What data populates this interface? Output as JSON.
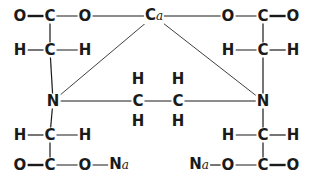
{
  "diagram": {
    "title": "",
    "atoms": [
      {
        "id": "o1",
        "label": "O",
        "x": 20,
        "y": 16
      },
      {
        "id": "c1",
        "label": "C",
        "x": 50,
        "y": 16
      },
      {
        "id": "o2",
        "label": "O",
        "x": 85,
        "y": 16
      },
      {
        "id": "ca",
        "label": "C",
        "sub": "a",
        "x": 154,
        "y": 16
      },
      {
        "id": "o3",
        "label": "O",
        "x": 228,
        "y": 16
      },
      {
        "id": "c2",
        "label": "C",
        "x": 263,
        "y": 16
      },
      {
        "id": "o4",
        "label": "O",
        "x": 293,
        "y": 16
      },
      {
        "id": "h1",
        "label": "H",
        "x": 20,
        "y": 50
      },
      {
        "id": "c3",
        "label": "C",
        "x": 50,
        "y": 50
      },
      {
        "id": "h2",
        "label": "H",
        "x": 85,
        "y": 50
      },
      {
        "id": "h3",
        "label": "H",
        "x": 228,
        "y": 50
      },
      {
        "id": "c4",
        "label": "C",
        "x": 263,
        "y": 50
      },
      {
        "id": "h4",
        "label": "H",
        "x": 293,
        "y": 50
      },
      {
        "id": "h5",
        "label": "H",
        "x": 138,
        "y": 79
      },
      {
        "id": "h6",
        "label": "H",
        "x": 178,
        "y": 79
      },
      {
        "id": "n1",
        "label": "N",
        "x": 53,
        "y": 101
      },
      {
        "id": "c5",
        "label": "C",
        "x": 138,
        "y": 101
      },
      {
        "id": "c6",
        "label": "C",
        "x": 178,
        "y": 101
      },
      {
        "id": "n2",
        "label": "N",
        "x": 263,
        "y": 101
      },
      {
        "id": "h7",
        "label": "H",
        "x": 138,
        "y": 121
      },
      {
        "id": "h8",
        "label": "H",
        "x": 178,
        "y": 121
      },
      {
        "id": "h9",
        "label": "H",
        "x": 20,
        "y": 135
      },
      {
        "id": "c7",
        "label": "C",
        "x": 50,
        "y": 135
      },
      {
        "id": "h10",
        "label": "H",
        "x": 85,
        "y": 135
      },
      {
        "id": "h11",
        "label": "H",
        "x": 228,
        "y": 135
      },
      {
        "id": "c8",
        "label": "C",
        "x": 263,
        "y": 135
      },
      {
        "id": "h12",
        "label": "H",
        "x": 293,
        "y": 135
      },
      {
        "id": "o5",
        "label": "O",
        "x": 20,
        "y": 165
      },
      {
        "id": "c9",
        "label": "C",
        "x": 50,
        "y": 165
      },
      {
        "id": "o6",
        "label": "O",
        "x": 85,
        "y": 165
      },
      {
        "id": "na1",
        "label": "N",
        "sub": "a",
        "x": 119,
        "y": 165
      },
      {
        "id": "na2",
        "label": "N",
        "sub": "a",
        "x": 199,
        "y": 165
      },
      {
        "id": "o7",
        "label": "O",
        "x": 228,
        "y": 165
      },
      {
        "id": "c10",
        "label": "C",
        "x": 263,
        "y": 165
      },
      {
        "id": "o8",
        "label": "O",
        "x": 293,
        "y": 165
      }
    ],
    "bonds": [
      {
        "from": "o1",
        "to": "c1",
        "type": "double"
      },
      {
        "from": "c1",
        "to": "o2",
        "type": "single"
      },
      {
        "from": "o2",
        "to": "ca",
        "type": "single"
      },
      {
        "from": "ca",
        "to": "o3",
        "type": "single"
      },
      {
        "from": "o3",
        "to": "c2",
        "type": "single"
      },
      {
        "from": "c2",
        "to": "o4",
        "type": "double"
      },
      {
        "from": "c1",
        "to": "c3",
        "type": "single"
      },
      {
        "from": "c2",
        "to": "c4",
        "type": "single"
      },
      {
        "from": "h1",
        "to": "c3",
        "type": "single"
      },
      {
        "from": "c3",
        "to": "h2",
        "type": "single"
      },
      {
        "from": "h3",
        "to": "c4",
        "type": "single"
      },
      {
        "from": "c4",
        "to": "h4",
        "type": "single"
      },
      {
        "from": "c3",
        "to": "n1",
        "type": "single"
      },
      {
        "from": "c4",
        "to": "n2",
        "type": "single"
      },
      {
        "from": "ca",
        "to": "n1",
        "type": "coordinate"
      },
      {
        "from": "ca",
        "to": "n2",
        "type": "coordinate"
      },
      {
        "from": "n1",
        "to": "c5",
        "type": "single"
      },
      {
        "from": "c5",
        "to": "c6",
        "type": "single"
      },
      {
        "from": "c6",
        "to": "n2",
        "type": "single"
      },
      {
        "from": "n1",
        "to": "c7",
        "type": "single"
      },
      {
        "from": "n2",
        "to": "c8",
        "type": "single"
      },
      {
        "from": "h9",
        "to": "c7",
        "type": "single"
      },
      {
        "from": "c7",
        "to": "h10",
        "type": "single"
      },
      {
        "from": "h11",
        "to": "c8",
        "type": "single"
      },
      {
        "from": "c8",
        "to": "h12",
        "type": "single"
      },
      {
        "from": "c7",
        "to": "c9",
        "type": "single"
      },
      {
        "from": "c8",
        "to": "c10",
        "type": "single"
      },
      {
        "from": "o5",
        "to": "c9",
        "type": "double"
      },
      {
        "from": "c9",
        "to": "o6",
        "type": "single"
      },
      {
        "from": "o6",
        "to": "na1",
        "type": "single"
      },
      {
        "from": "na2",
        "to": "o7",
        "type": "single"
      },
      {
        "from": "o7",
        "to": "c10",
        "type": "single"
      },
      {
        "from": "c10",
        "to": "o8",
        "type": "double"
      }
    ]
  }
}
